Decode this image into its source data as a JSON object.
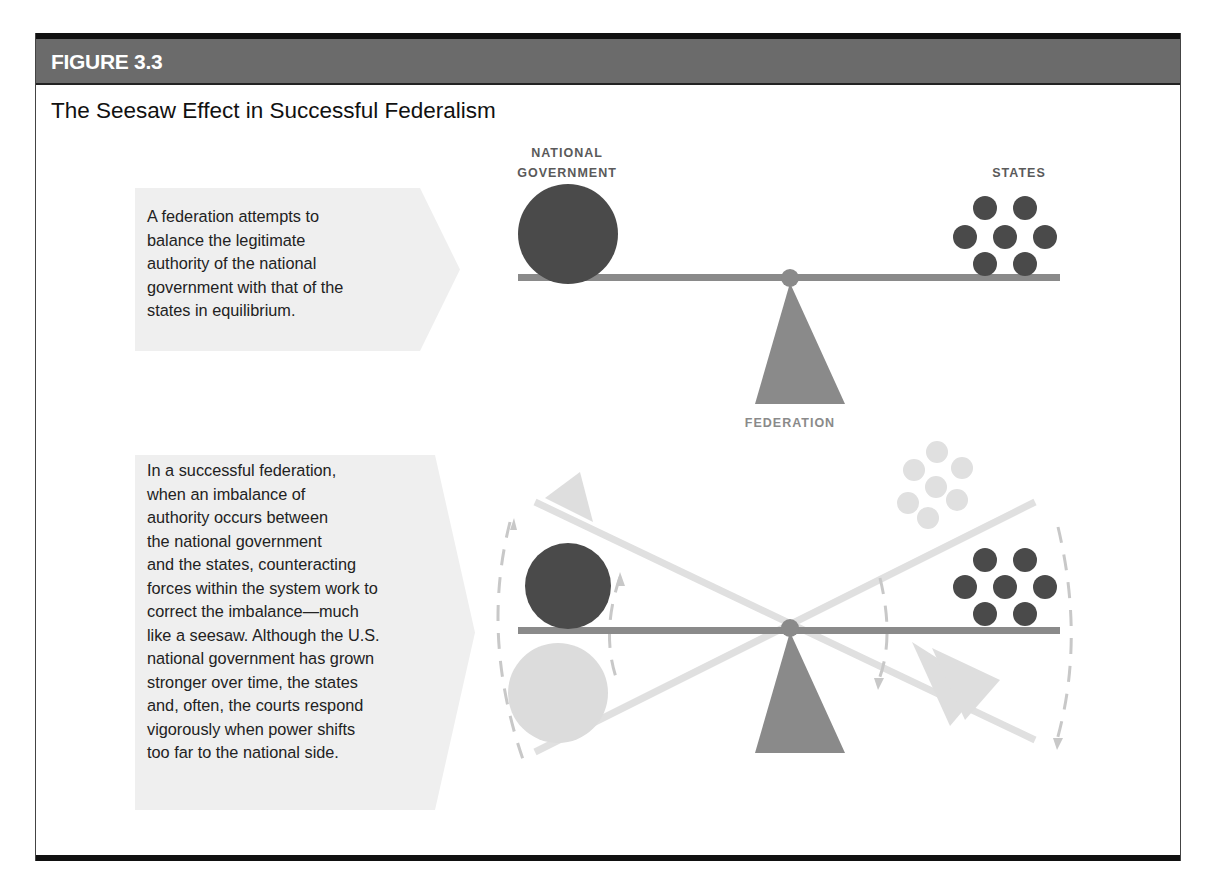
{
  "figure": {
    "label": "FIGURE 3.3",
    "title": "The Seesaw Effect in Successful Federalism"
  },
  "top_panel": {
    "callout_lines": [
      "A federation attempts to",
      "balance the legitimate",
      "authority of the national",
      "government with that of the",
      "states in equilibrium."
    ],
    "labels": {
      "national_line1": "NATIONAL",
      "national_line2": "GOVERNMENT",
      "states": "STATES",
      "federation": "FEDERATION"
    }
  },
  "bottom_panel": {
    "callout_lines": [
      "In a successful federation,",
      "when an imbalance of",
      "authority occurs between",
      "the national government",
      "and the states, counteracting",
      "forces within the system work to",
      "correct the imbalance—much",
      "like a seesaw. Although the U.S.",
      "national government has grown",
      "stronger over time, the states",
      "and, often, the courts respond",
      "vigorously when power shifts",
      "too far to the national side."
    ]
  },
  "colors": {
    "dark": "#4a4a4a",
    "mid": "#8a8a8a",
    "light": "#d9d9d9",
    "callout_bg": "#efefef",
    "header_bg": "#6b6b6b"
  }
}
